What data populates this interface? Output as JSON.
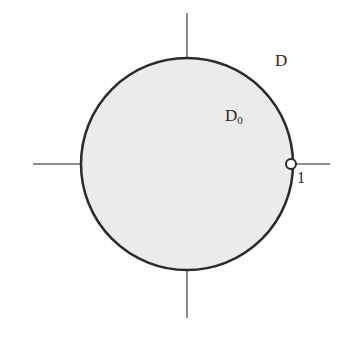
{
  "figure": {
    "background_color": "#ffffff",
    "width": 350,
    "height": 341
  },
  "labels": {
    "outer_region": "D",
    "inner_region_base": "D",
    "inner_region_subscript": "0",
    "boundary_point": "1"
  },
  "colors": {
    "disk_fill": "#ebebeb",
    "disk_stroke": "#2a2a2a",
    "axis_stroke": "#8d8d8d",
    "marker_fill": "#ffffff",
    "marker_stroke": "#2a2a2a",
    "text": "#2b2b2b"
  },
  "chart_data": {
    "type": "scatter",
    "xlabel": "",
    "ylabel": "",
    "xlim": [
      -1.45,
      1.35
    ],
    "ylim": [
      -1.45,
      1.42
    ],
    "grid": false,
    "legend": null,
    "axes": {
      "x_axis": {
        "y": 0,
        "x_start": -1.45,
        "x_end": 1.35,
        "style": "thin-gray-line"
      },
      "y_axis": {
        "x": 0,
        "y_start": 1.42,
        "y_end": -1.45,
        "style": "thin-gray-line"
      }
    },
    "shapes": [
      {
        "name": "unit-disk",
        "type": "circle",
        "center": [
          0,
          0
        ],
        "radius": 1,
        "fill": "#ebebeb",
        "stroke": "#2a2a2a",
        "stroke_width": 2.5,
        "label": "D_0"
      }
    ],
    "points": [
      {
        "name": "boundary-point-one",
        "x": 1,
        "y": 0,
        "marker": "open-circle",
        "radius_px": 5,
        "fill": "#ffffff",
        "stroke": "#2a2a2a",
        "label": "1"
      }
    ],
    "annotations": [
      {
        "text": "D",
        "x": 0.9,
        "y": 0.96,
        "role": "outer-region-label"
      },
      {
        "text": "D₀",
        "x": 0.47,
        "y": 0.46,
        "role": "inner-region-label"
      },
      {
        "text": "1",
        "x": 1.08,
        "y": -0.16,
        "role": "point-label"
      }
    ],
    "pixel_geometry": {
      "circle_center_px": [
        187,
        164
      ],
      "circle_radius_px": 106,
      "x_axis_px": {
        "y": 164,
        "x1": 33,
        "x2": 330
      },
      "y_axis_px": {
        "x": 187,
        "y1": 13,
        "y2": 318
      },
      "marker_px": [
        291,
        164
      ]
    }
  }
}
